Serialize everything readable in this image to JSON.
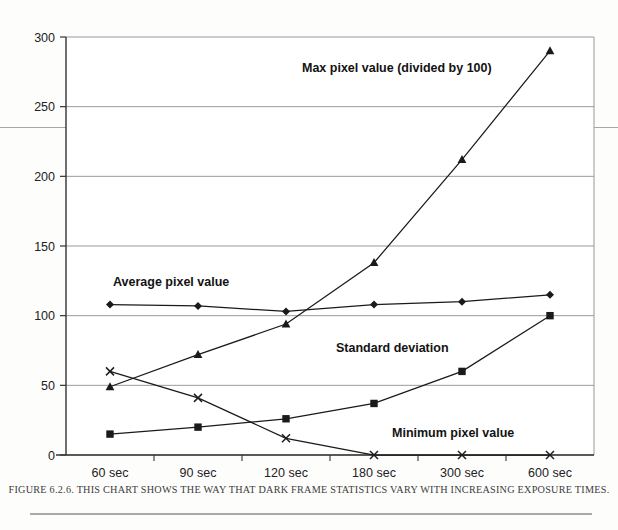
{
  "figure": {
    "caption": "FIGURE 6.2.6. THIS CHART SHOWS THE WAY THAT DARK FRAME STATISTICS VARY WITH INCREASING EXPOSURE TIMES."
  },
  "chart_data": {
    "type": "line",
    "title": "",
    "xlabel": "",
    "ylabel": "",
    "categories": [
      "60 sec",
      "90 sec",
      "120 sec",
      "180 sec",
      "300 sec",
      "600 sec"
    ],
    "ylim": [
      0,
      300
    ],
    "yticks": [
      0,
      50,
      100,
      150,
      200,
      250,
      300
    ],
    "ytick_labels": [
      "0",
      "50",
      "100",
      "150",
      "200",
      "250",
      "300"
    ],
    "grid": true,
    "legend_position": "inline-annotations",
    "series": [
      {
        "name": "Max pixel value (divided by 100)",
        "marker": "triangle",
        "values": [
          49,
          72,
          94,
          138,
          212,
          290
        ]
      },
      {
        "name": "Average pixel value",
        "marker": "diamond",
        "values": [
          108,
          107,
          103,
          108,
          110,
          115
        ]
      },
      {
        "name": "Standard deviation",
        "marker": "square",
        "values": [
          15,
          20,
          26,
          37,
          60,
          100
        ]
      },
      {
        "name": "Minimum pixel value",
        "marker": "cross",
        "values": [
          60,
          41,
          12,
          0,
          0,
          0
        ]
      }
    ],
    "annotations": [
      {
        "text": "Max pixel value (divided by 100)",
        "x_px": 302,
        "y_px": 72
      },
      {
        "text": "Average pixel value",
        "x_px": 113,
        "y_px": 286
      },
      {
        "text": "Standard deviation",
        "x_px": 336,
        "y_px": 352
      },
      {
        "text": "Minimum pixel value",
        "x_px": 392,
        "y_px": 437
      }
    ],
    "colors": {
      "line": "#1a1a1a",
      "grid": "#9a9a9a",
      "axis": "#333333",
      "background": "#ffffff"
    }
  }
}
